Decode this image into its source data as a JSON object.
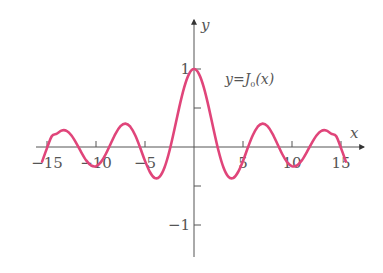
{
  "chart_data": {
    "type": "line",
    "title": "",
    "annotation": "y=J0(x)",
    "annotation_parts": {
      "lhs": "y",
      "eq": "=",
      "func": "J",
      "sub": "0",
      "arg": "(x)"
    },
    "xlabel": "x",
    "ylabel": "y",
    "xlim": [
      -15.5,
      17
    ],
    "ylim": [
      -1.4,
      1.7
    ],
    "x_ticks": [
      -15,
      -10,
      -5,
      5,
      10,
      15
    ],
    "x_tick_labels": [
      "−15",
      "−10",
      "−5",
      "5",
      "10",
      "15"
    ],
    "y_ticks": [
      1,
      0.5,
      -0.5,
      -1
    ],
    "y_tick_labels": [
      "1",
      "",
      "",
      "−1"
    ],
    "grid": false,
    "legend": null,
    "series": [
      {
        "name": "J0(x)",
        "color": "#e0457a",
        "x": [
          -15.5,
          -15,
          -14.5,
          -14,
          -13.5,
          -13,
          -12.5,
          -12,
          -11.5,
          -11,
          -10.5,
          -10,
          -9.5,
          -9,
          -8.5,
          -8,
          -7.5,
          -7,
          -6.5,
          -6,
          -5.5,
          -5,
          -4.5,
          -4,
          -3.5,
          -3,
          -2.5,
          -2,
          -1.5,
          -1,
          -0.5,
          0,
          0.5,
          1,
          1.5,
          2,
          2.5,
          3,
          3.5,
          4,
          4.5,
          5,
          5.5,
          6,
          6.5,
          7,
          7.5,
          8,
          8.5,
          9,
          9.5,
          10,
          10.5,
          11,
          11.5,
          12,
          12.5,
          13,
          13.5,
          14,
          14.5,
          15,
          15.5
        ],
        "values": [
          -0.1876,
          -0.0142,
          0.1407,
          0.1711,
          0.212,
          0.2069,
          0.1469,
          0.0477,
          -0.0677,
          -0.1712,
          -0.2366,
          -0.2459,
          -0.1939,
          -0.0903,
          0.0419,
          0.1717,
          0.2663,
          0.3001,
          0.2601,
          0.1506,
          -0.0068,
          -0.1776,
          -0.3205,
          -0.3971,
          -0.3801,
          -0.2601,
          -0.0484,
          0.2239,
          0.5118,
          0.7652,
          0.9385,
          1.0,
          0.9385,
          0.7652,
          0.5118,
          0.2239,
          -0.0484,
          -0.2601,
          -0.3801,
          -0.3971,
          -0.3205,
          -0.1776,
          -0.0068,
          0.1506,
          0.2601,
          0.3001,
          0.2663,
          0.1717,
          0.0419,
          -0.0903,
          -0.1939,
          -0.2459,
          -0.2366,
          -0.1712,
          -0.0677,
          0.0477,
          0.1469,
          0.2069,
          0.212,
          0.1711,
          0.1407,
          -0.0142,
          -0.1876
        ]
      }
    ]
  },
  "colors": {
    "curve": "#e0457a",
    "axis": "#555555",
    "text": "#555555",
    "background": "#ffffff"
  }
}
